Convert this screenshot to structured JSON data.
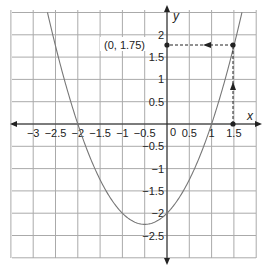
{
  "chart_data": {
    "type": "line",
    "title": "",
    "xlabel": "x",
    "ylabel": "y",
    "xlim": [
      -3.5,
      2.0
    ],
    "ylim": [
      -3.0,
      2.5
    ],
    "grid": true,
    "grid_step": 0.5,
    "x_ticks": [
      "−3",
      "−2.5",
      "−2",
      "−1.5",
      "−1",
      "−0.5",
      "0.5",
      "1",
      "1.5"
    ],
    "x_tick_values": [
      -3,
      -2.5,
      -2,
      -1.5,
      -1,
      -0.5,
      0.5,
      1,
      1.5
    ],
    "y_ticks": [
      "2",
      "1.5",
      "1",
      "0.5",
      "−0.5",
      "−1",
      "−1.5",
      "−2",
      "−2.5"
    ],
    "y_tick_values": [
      2,
      1.5,
      1,
      0.5,
      -0.5,
      -1,
      -1.5,
      -2,
      -2.5
    ],
    "origin_label": "0",
    "series": [
      {
        "name": "y = x² + x − 2",
        "color": "#777777",
        "x": [
          -3,
          -2.5,
          -2,
          -1.5,
          -1,
          -0.5,
          0,
          0.5,
          1,
          1.5,
          1.7
        ],
        "values": [
          4,
          1.75,
          0,
          -1.25,
          -2,
          -2.25,
          -2,
          -1.25,
          0,
          1.75,
          2.59
        ]
      }
    ],
    "annotations": [
      {
        "type": "point",
        "x": 1.5,
        "y": 0
      },
      {
        "type": "point",
        "x": 1.5,
        "y": 1.75
      },
      {
        "type": "point",
        "x": 0,
        "y": 1.75
      },
      {
        "type": "dashed-arrow",
        "from": [
          1.5,
          0
        ],
        "to": [
          1.5,
          1.75
        ],
        "direction": "up"
      },
      {
        "type": "dashed-arrow",
        "from": [
          1.5,
          1.75
        ],
        "to": [
          0,
          1.75
        ],
        "direction": "left"
      },
      {
        "type": "label",
        "text": "(0, 1.75)",
        "x": 0,
        "y": 1.75
      }
    ]
  },
  "labels": {
    "x_axis": "x",
    "y_axis": "y",
    "origin": "0",
    "point_label": "(0, 1.75)"
  }
}
